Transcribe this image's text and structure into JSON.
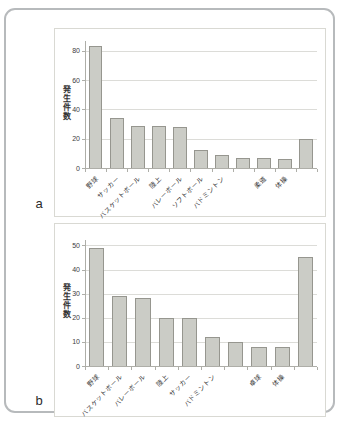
{
  "figure": {
    "panel_a_label": "a",
    "panel_b_label": "b"
  },
  "colors": {
    "bar_fill": "#cbccc6",
    "bar_border": "#96968f",
    "gridline": "#dcdcd8",
    "axis": "#aeaea8",
    "text": "#333333"
  },
  "chart_data": [
    {
      "id": "a",
      "type": "bar",
      "title": "",
      "xlabel": "",
      "ylabel": "発生件数",
      "ylim": [
        0,
        80
      ],
      "yticks": [
        0,
        20,
        40,
        60,
        80
      ],
      "grid": true,
      "legend": "none",
      "categories": [
        "野球",
        "サッカー",
        "バスケットボール",
        "陸上",
        "バレーボール",
        "ソフトボール",
        "バドミントン",
        "",
        "柔道",
        "体操",
        ""
      ],
      "values": [
        83,
        34,
        29,
        29,
        28,
        12,
        9,
        7,
        7,
        6,
        20
      ]
    },
    {
      "id": "b",
      "type": "bar",
      "title": "",
      "xlabel": "",
      "ylabel": "発生件数",
      "ylim": [
        0,
        50
      ],
      "yticks": [
        0,
        10,
        20,
        30,
        40,
        50
      ],
      "grid": true,
      "legend": "none",
      "categories": [
        "野球",
        "バスケットボール",
        "バレーボール",
        "陸上",
        "サッカー",
        "バドミントン",
        "",
        "卓球",
        "体操",
        ""
      ],
      "values": [
        49,
        29,
        28,
        20,
        20,
        12,
        10,
        8,
        8,
        45
      ]
    }
  ]
}
